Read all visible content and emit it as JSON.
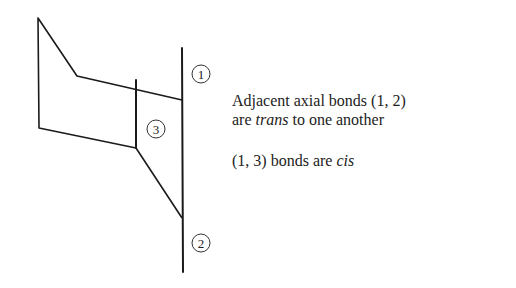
{
  "diagram": {
    "labels": [
      {
        "id": "1",
        "text": "1",
        "cx": 201,
        "cy": 74
      },
      {
        "id": "3",
        "text": "3",
        "cx": 156,
        "cy": 129
      },
      {
        "id": "2",
        "text": "2",
        "cx": 201,
        "cy": 243
      }
    ],
    "stroke_color": "#1a1a1a"
  },
  "captions": {
    "line1": "Adjacent axial bonds (1, 2)",
    "line2_pre": "are ",
    "line2_em": "trans",
    "line2_post": " to one another",
    "line3_pre": "(1, 3) bonds are ",
    "line3_em": "cis"
  }
}
